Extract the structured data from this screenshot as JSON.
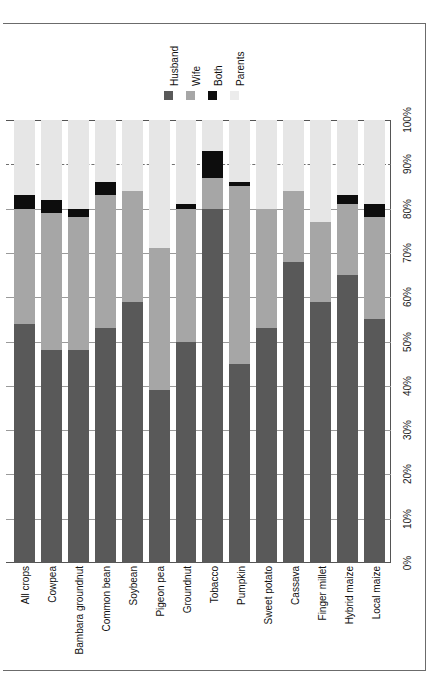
{
  "chart_data": {
    "type": "bar",
    "subtype": "stacked-bar-100-percent",
    "orientation": "vertical-bars-rotated-page",
    "title": "",
    "xlabel": "",
    "ylabel": "",
    "ylim": [
      0,
      100
    ],
    "grid": true,
    "legend_position": "top-center",
    "categories": [
      "All crops",
      "Cowpea",
      "Bambara groundnut",
      "Common bean",
      "Soybean",
      "Pigeon pea",
      "Groundnut",
      "Tobacco",
      "Pumpkin",
      "Sweet potato",
      "Cassava",
      "Finger millet",
      "Hybrid maize",
      "Local maize"
    ],
    "series": [
      {
        "name": "Husband",
        "color": "#595959",
        "values": [
          54,
          48,
          48,
          53,
          59,
          39,
          50,
          80,
          45,
          53,
          68,
          59,
          65,
          55
        ]
      },
      {
        "name": "Wife",
        "color": "#a6a6a6",
        "values": [
          26,
          31,
          30,
          30,
          25,
          32,
          30,
          7,
          40,
          27,
          16,
          18,
          16,
          23
        ]
      },
      {
        "name": "Both",
        "color": "#0d0d0d",
        "values": [
          3,
          3,
          2,
          3,
          0,
          0,
          1,
          6,
          1,
          0,
          0,
          0,
          2,
          3
        ]
      },
      {
        "name": "Parents",
        "color": "#e6e6e6",
        "values": [
          17,
          18,
          20,
          14,
          16,
          29,
          19,
          7,
          14,
          20,
          16,
          23,
          17,
          19
        ]
      }
    ],
    "tick_labels": [
      "0%",
      "10%",
      "20%",
      "30%",
      "40%",
      "50%",
      "60%",
      "70%",
      "80%",
      "90%",
      "100%"
    ],
    "tick_values": [
      0,
      10,
      20,
      30,
      40,
      50,
      60,
      70,
      80,
      90,
      100
    ],
    "dashed_gridlines_at": [
      90
    ]
  },
  "legend": {
    "items": [
      {
        "label": "Husband",
        "swatch_class": "sw-husband",
        "color": "#595959"
      },
      {
        "label": "Wife",
        "swatch_class": "sw-wife",
        "color": "#a6a6a6"
      },
      {
        "label": "Both",
        "swatch_class": "sw-both",
        "color": "#0d0d0d"
      },
      {
        "label": "Parents",
        "swatch_class": "sw-parents",
        "color": "#ececec"
      }
    ]
  }
}
